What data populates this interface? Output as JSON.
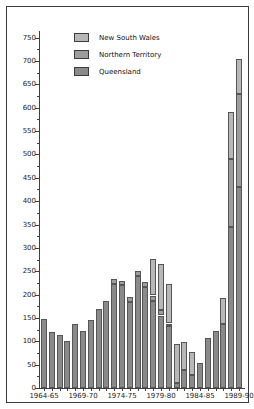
{
  "chart_data": {
    "type": "bar",
    "stacked": true,
    "title": "",
    "xlabel": "",
    "ylabel": "",
    "categories": [
      "1964-65",
      "1965-66",
      "1966-67",
      "1967-68",
      "1968-69",
      "1969-70",
      "1970-71",
      "1971-72",
      "1972-73",
      "1973-74",
      "1974-75",
      "1975-76",
      "1976-77",
      "1977-78",
      "1978-79",
      "1979-80",
      "1980-81",
      "1981-82",
      "1982-83",
      "1983-84",
      "1984-85",
      "1985-86",
      "1986-87",
      "1987-88",
      "1988-89",
      "1989-90"
    ],
    "series": [
      {
        "name": "Queensland",
        "color": "#8a8a8a",
        "values": [
          148,
          120,
          113,
          100,
          138,
          122,
          145,
          170,
          186,
          222,
          220,
          185,
          240,
          217,
          187,
          155,
          132,
          10,
          38,
          27,
          53,
          107,
          122,
          137,
          345,
          430
        ]
      },
      {
        "name": "Northern Territory",
        "color": "#9d9d9d",
        "values": [
          0,
          0,
          0,
          0,
          0,
          0,
          0,
          0,
          0,
          11,
          10,
          10,
          10,
          10,
          11,
          11,
          6,
          0,
          0,
          0,
          0,
          0,
          0,
          0,
          145,
          200
        ]
      },
      {
        "name": "New South Wales",
        "color": "#b8b8b8",
        "values": [
          0,
          0,
          0,
          0,
          0,
          0,
          0,
          0,
          0,
          0,
          0,
          0,
          0,
          0,
          79,
          100,
          85,
          85,
          60,
          50,
          0,
          0,
          0,
          56,
          100,
          75
        ]
      }
    ],
    "legend": {
      "position": "top-left",
      "entries": [
        {
          "label": "New South Wales",
          "color": "#b8b8b8"
        },
        {
          "label": "Northern Territory",
          "color": "#9d9d9d"
        },
        {
          "label": "Queensland",
          "color": "#8a8a8a"
        }
      ]
    },
    "ylim": [
      0,
      750
    ],
    "y_tick_step": 50,
    "y_minor_tick_step": 25,
    "y_tick_labels": [
      "0",
      "50",
      "100",
      "150",
      "200",
      "250",
      "300",
      "350",
      "400",
      "450",
      "500",
      "550",
      "600",
      "650",
      "700",
      "750"
    ],
    "x_tick_labels": [
      "1964-65",
      "1969-70",
      "1974-75",
      "1979-80",
      "1984-85",
      "1989-90"
    ],
    "x_tick_indices": [
      0,
      5,
      10,
      15,
      20,
      25
    ],
    "grid": false
  }
}
